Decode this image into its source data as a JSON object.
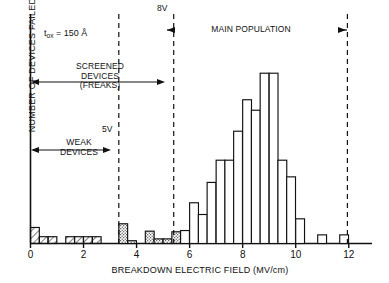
{
  "chart_data": {
    "type": "bar",
    "title": "",
    "xlabel": "BREAKDOWN ELECTRIC FIELD (MV/cm)",
    "ylabel": "NUMBER OF DEVICES FAILED",
    "xlim": [
      0,
      13.5
    ],
    "ylim": [
      0,
      30
    ],
    "xticks": [
      0,
      2,
      4,
      6,
      8,
      10,
      12
    ],
    "xticklabels": [
      "0",
      "2",
      "4",
      "6",
      "8",
      "10",
      "12"
    ],
    "yticks": [],
    "grid": false,
    "legend": "none",
    "bin_width": 0.333,
    "bar_style_legend": {
      "hatched": "WEAK DEVICES (diagonal hatch fill)",
      "stippled": "SCREENED DEVICES / FREAKS (stipple fill)",
      "open": "MAIN POPULATION (unfilled)"
    },
    "bars": [
      {
        "x": 0.0,
        "value": 2.6,
        "fill": "hatched"
      },
      {
        "x": 0.33,
        "value": 1.1,
        "fill": "hatched"
      },
      {
        "x": 0.66,
        "value": 1.1,
        "fill": "hatched"
      },
      {
        "x": 1.33,
        "value": 1.1,
        "fill": "hatched"
      },
      {
        "x": 1.66,
        "value": 1.1,
        "fill": "hatched"
      },
      {
        "x": 2.0,
        "value": 1.1,
        "fill": "hatched"
      },
      {
        "x": 2.33,
        "value": 1.1,
        "fill": "hatched"
      },
      {
        "x": 3.33,
        "value": 3.2,
        "fill": "stippled"
      },
      {
        "x": 3.66,
        "value": 0.45,
        "fill": "stippled"
      },
      {
        "x": 4.33,
        "value": 2.0,
        "fill": "stippled"
      },
      {
        "x": 4.66,
        "value": 0.75,
        "fill": "stippled"
      },
      {
        "x": 5.0,
        "value": 0.75,
        "fill": "stippled"
      },
      {
        "x": 5.33,
        "value": 1.9,
        "fill": "stippled"
      },
      {
        "x": 5.66,
        "value": 2.1,
        "fill": "open"
      },
      {
        "x": 6.0,
        "value": 6.6,
        "fill": "open"
      },
      {
        "x": 6.33,
        "value": 4.7,
        "fill": "open"
      },
      {
        "x": 6.66,
        "value": 9.9,
        "fill": "open"
      },
      {
        "x": 7.0,
        "value": 13.5,
        "fill": "open"
      },
      {
        "x": 7.33,
        "value": 13.5,
        "fill": "open"
      },
      {
        "x": 7.66,
        "value": 18.2,
        "fill": "open"
      },
      {
        "x": 8.0,
        "value": 23.3,
        "fill": "open"
      },
      {
        "x": 8.33,
        "value": 21.6,
        "fill": "open"
      },
      {
        "x": 8.66,
        "value": 27.6,
        "fill": "open"
      },
      {
        "x": 9.0,
        "value": 27.6,
        "fill": "open"
      },
      {
        "x": 9.33,
        "value": 13.5,
        "fill": "open"
      },
      {
        "x": 9.66,
        "value": 10.8,
        "fill": "open"
      },
      {
        "x": 10.0,
        "value": 4.0,
        "fill": "open"
      },
      {
        "x": 10.83,
        "value": 1.4,
        "fill": "open"
      },
      {
        "x": 11.66,
        "value": 1.4,
        "fill": "open"
      }
    ],
    "annotations": [
      {
        "name": "tox-note",
        "text": "t",
        "sub": "ox",
        "rest": " = 150 Å",
        "x": 1.6,
        "y_frac": 0.87
      },
      {
        "name": "weak-devices",
        "text": "WEAK\nDEVICES"
      },
      {
        "name": "screened-devices",
        "text": "SCREENED\nDEVICES\n(FREAKS)"
      },
      {
        "name": "main-population",
        "text": "MAIN POPULATION"
      }
    ],
    "vertical_markers": [
      {
        "label": "5V",
        "x": 3.33
      },
      {
        "label": "8V",
        "x": 5.4
      },
      {
        "label": "",
        "x": 11.95
      }
    ]
  },
  "labels": {
    "y_axis": "NUMBER OF DEVICES FAILED",
    "x_axis": "BREAKDOWN ELECTRIC FIELD (MV/cm)",
    "tox_prefix": "t",
    "tox_sub": "ox",
    "tox_value": " = 150 Å",
    "weak_line1": "WEAK",
    "weak_line2": "DEVICES",
    "screened_line1": "SCREENED",
    "screened_line2": "DEVICES",
    "screened_line3": "(FREAKS)",
    "main_population": "MAIN POPULATION",
    "marker_5v": "5V",
    "marker_8v": "8V",
    "tick_0": "0",
    "tick_2": "2",
    "tick_4": "4",
    "tick_6": "6",
    "tick_8": "8",
    "tick_10": "10",
    "tick_12": "12"
  },
  "colors": {
    "ink": "#111111",
    "background": "#ffffff",
    "bar_stroke": "#111111",
    "dashed": "#111111"
  }
}
